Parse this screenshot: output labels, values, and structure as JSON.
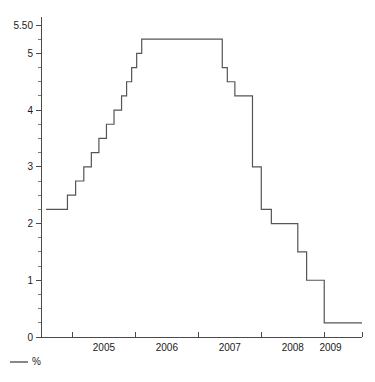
{
  "chart_data": {
    "type": "line",
    "title": "",
    "subtitle": "",
    "xlabel": "",
    "ylabel": "",
    "xlim": [
      2004.5,
      2009.6
    ],
    "ylim": [
      0,
      5.5
    ],
    "grid": false,
    "legend_position": "bottom-left",
    "line_color": "#555555",
    "axis_color": "#4a4a4a",
    "step_style": "post",
    "y_ticks_major": [
      0,
      1,
      2,
      3,
      4,
      5,
      5.5
    ],
    "y_tick_labels": [
      "0",
      "1",
      "2",
      "3",
      "4",
      "5",
      "5.50"
    ],
    "y_ticks_minor_step": 0.25,
    "x_ticks_major": [
      2005,
      2006,
      2007,
      2008,
      2009
    ],
    "x_tick_labels": [
      "2005",
      "2006",
      "2007",
      "2008",
      "2009"
    ],
    "x_label_positions": [
      2005.5,
      2006.5,
      2007.5,
      2008.5,
      2009.1
    ],
    "series": [
      {
        "name": "%",
        "legend_label": "%",
        "x": [
          2004.58,
          2004.8,
          2004.92,
          2005.05,
          2005.18,
          2005.3,
          2005.42,
          2005.54,
          2005.66,
          2005.78,
          2005.86,
          2005.94,
          2006.02,
          2006.1,
          2006.22,
          2006.34,
          2007.28,
          2007.38,
          2007.46,
          2007.52,
          2007.58,
          2007.72,
          2007.86,
          2008.0,
          2008.16,
          2008.3,
          2008.44,
          2008.58,
          2008.72,
          2009.0,
          2009.5
        ],
        "values": [
          2.25,
          2.25,
          2.5,
          2.75,
          3.0,
          3.25,
          3.5,
          3.75,
          4.0,
          4.25,
          4.5,
          4.75,
          5.0,
          5.25,
          5.25,
          5.25,
          5.25,
          4.75,
          4.5,
          4.5,
          4.25,
          4.25,
          3.0,
          2.25,
          2.0,
          2.0,
          2.0,
          1.5,
          1.0,
          0.25,
          0.25
        ],
        "min_value": 0.25,
        "max_value": 5.25,
        "start_value": 2.25,
        "end_value": 0.25,
        "units": "%"
      }
    ],
    "legend": [
      {
        "label": "%",
        "color": "#555555",
        "marker": "line"
      }
    ]
  }
}
